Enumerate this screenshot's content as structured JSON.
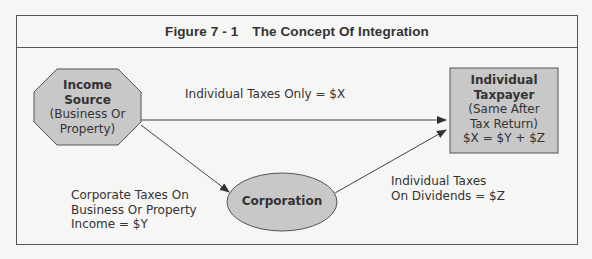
{
  "figure": {
    "number": "Figure 7 - 1",
    "title": "The Concept Of Integration"
  },
  "nodes": {
    "income_source": {
      "shape": "octagon",
      "title_lines": [
        "Income",
        "Source"
      ],
      "sub_lines": [
        "(Business Or",
        "Property)"
      ],
      "fill": "#c8c8c8"
    },
    "taxpayer": {
      "shape": "rectangle",
      "title_lines": [
        "Individual",
        "Taxpayer"
      ],
      "sub_lines": [
        "(Same After",
        "Tax Return)",
        "$X = $Y + $Z"
      ],
      "fill": "#c8c8c8"
    },
    "corporation": {
      "shape": "ellipse",
      "title": "Corporation",
      "fill": "#c8c8c8"
    }
  },
  "edges": {
    "direct": {
      "label": "Individual Taxes Only = $X"
    },
    "corporate": {
      "label_lines": [
        "Corporate Taxes On",
        "Business Or Property",
        "Income = $Y"
      ]
    },
    "dividends": {
      "label_lines": [
        "Individual Taxes",
        "On Dividends = $Z"
      ]
    }
  },
  "colors": {
    "line": "#444444",
    "node_fill": "#c8c8c8",
    "background": "#f6f6f4"
  }
}
